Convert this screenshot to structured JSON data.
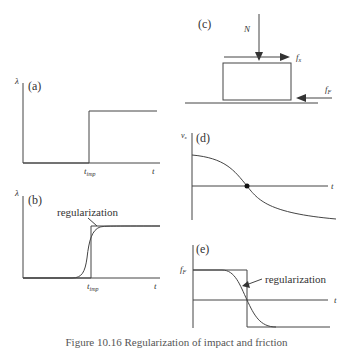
{
  "panels": {
    "a": {
      "tag": "(a)",
      "ylabel": "λ",
      "xtick": "t",
      "xtick_sub": "imp",
      "xlabel": "t"
    },
    "b": {
      "tag": "(b)",
      "ylabel": "λ",
      "xtick": "t",
      "xtick_sub": "imp",
      "xlabel": "t",
      "annotation": "regularization"
    },
    "c": {
      "tag": "(c)",
      "force_normal": "N",
      "force_x": "f",
      "force_x_sub": "x",
      "force_friction": "f",
      "force_friction_sub": "F"
    },
    "d": {
      "tag": "(d)",
      "ylabel": "v",
      "ylabel_sub": "x",
      "xlabel": "t"
    },
    "e": {
      "tag": "(e)",
      "ylabel": "f",
      "ylabel_sub": "F",
      "xlabel": "t",
      "annotation": "regularization"
    }
  },
  "caption": "Figure 10.16  Regularization of impact and friction",
  "colors": {
    "line": "#444444",
    "text": "#333333"
  }
}
